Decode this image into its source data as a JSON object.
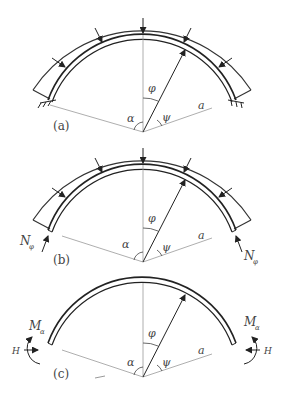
{
  "figures": [
    {
      "id": "a",
      "label": "(a)",
      "support": "fixed",
      "angle_labels": {
        "phi": "φ",
        "psi": "ψ",
        "alpha": "α",
        "radius": "a"
      }
    },
    {
      "id": "b",
      "label": "(b)",
      "support": "normal-force",
      "force_label": "N",
      "force_sub": "φ",
      "angle_labels": {
        "phi": "φ",
        "psi": "ψ",
        "alpha": "α",
        "radius": "a"
      }
    },
    {
      "id": "c",
      "label": "(c)",
      "support": "moment",
      "moment_label": "M",
      "moment_sub": "α",
      "horizontal_label": "H",
      "angle_labels": {
        "phi": "φ",
        "psi": "ψ",
        "alpha": "α",
        "radius": "a"
      }
    }
  ]
}
